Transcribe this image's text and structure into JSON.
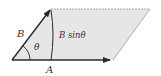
{
  "diagram": {
    "type": "parallelogram-cross-product",
    "labels": {
      "vector_a": "A",
      "vector_b": "B",
      "angle": "θ",
      "height": "B sinθ"
    },
    "colors": {
      "fill": "#e6e6e6",
      "stroke": "#2a2a2a",
      "edge_light": "#9a9a9a"
    },
    "vertices": {
      "origin": [
        12,
        60
      ],
      "b_tip": [
        51,
        9
      ],
      "top_right": [
        150,
        9
      ],
      "a_tip": [
        113,
        60
      ]
    }
  }
}
